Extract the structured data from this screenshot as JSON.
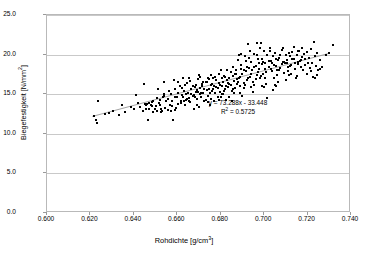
{
  "chart_data": {
    "type": "scatter",
    "title": "",
    "xlabel": "Rohdichte [g/cm³]",
    "ylabel": "Biegefestigkeit [N/mm²]",
    "xlabel_base": "Rohdichte [g/cm",
    "xlabel_sup": "3",
    "xlabel_tail": "]",
    "ylabel_base": "Biegefestigkeit [N/mm",
    "ylabel_sup": "2",
    "ylabel_tail": "]",
    "xlim": [
      0.6,
      0.74
    ],
    "ylim": [
      0.0,
      25.0
    ],
    "xticks": [
      0.6,
      0.62,
      0.64,
      0.66,
      0.68,
      0.7,
      0.72,
      0.74
    ],
    "yticks": [
      0.0,
      5.0,
      10.0,
      15.0,
      20.0,
      25.0
    ],
    "xtick_labels": [
      "0.600",
      "0.620",
      "0.640",
      "0.660",
      "0.680",
      "0.700",
      "0.720",
      "0.740"
    ],
    "ytick_labels": [
      "0.0",
      "5.0",
      "10.0",
      "15.0",
      "20.0",
      "25.0"
    ],
    "grid": "horizontal",
    "legend": "none",
    "marker_color": "#000000",
    "marker_shape": "square",
    "gridline_color": "#c9c9c9",
    "border_color": "#b9b9b9",
    "trendline": {
      "type": "linear",
      "slope": 73.288,
      "intercept": -33.448,
      "r_squared": 0.5725,
      "equation_label": "y = 73.288x - 33.448",
      "r2_label_base": "R",
      "r2_label_sup": "2",
      "r2_label_tail": " = 0.5725",
      "color": "#8c8c8c",
      "x_start": 0.621,
      "x_end": 0.731
    },
    "points": [
      [
        0.6215,
        12.2
      ],
      [
        0.6225,
        11.7
      ],
      [
        0.623,
        11.4
      ],
      [
        0.6235,
        14.1
      ],
      [
        0.6265,
        12.5
      ],
      [
        0.6285,
        12.6
      ],
      [
        0.6305,
        12.9
      ],
      [
        0.633,
        12.4
      ],
      [
        0.6345,
        13.6
      ],
      [
        0.636,
        12.8
      ],
      [
        0.6385,
        13.4
      ],
      [
        0.64,
        13.1
      ],
      [
        0.641,
        14.9
      ],
      [
        0.642,
        13.9
      ],
      [
        0.643,
        13.4
      ],
      [
        0.644,
        12.9
      ],
      [
        0.6445,
        16.3
      ],
      [
        0.645,
        13.8
      ],
      [
        0.6455,
        13.7
      ],
      [
        0.646,
        13.8
      ],
      [
        0.6465,
        11.7
      ],
      [
        0.647,
        13.2
      ],
      [
        0.648,
        13.6
      ],
      [
        0.6485,
        14.0
      ],
      [
        0.649,
        12.7
      ],
      [
        0.6495,
        13.1
      ],
      [
        0.65,
        13.5
      ],
      [
        0.6505,
        12.9
      ],
      [
        0.651,
        15.7
      ],
      [
        0.6515,
        13.9
      ],
      [
        0.652,
        14.3
      ],
      [
        0.6525,
        13.2
      ],
      [
        0.653,
        12.9
      ],
      [
        0.6535,
        14.6
      ],
      [
        0.654,
        16.5
      ],
      [
        0.6545,
        13.3
      ],
      [
        0.655,
        14.1
      ],
      [
        0.6555,
        14.4
      ],
      [
        0.656,
        15.4
      ],
      [
        0.6565,
        13.7
      ],
      [
        0.657,
        12.9
      ],
      [
        0.6575,
        14.2
      ],
      [
        0.658,
        11.8
      ],
      [
        0.6585,
        16.8
      ],
      [
        0.659,
        14.7
      ],
      [
        0.6595,
        13.3
      ],
      [
        0.66,
        14.6
      ],
      [
        0.6605,
        15.1
      ],
      [
        0.661,
        16.1
      ],
      [
        0.6615,
        14.2
      ],
      [
        0.662,
        14.9
      ],
      [
        0.6625,
        17.1
      ],
      [
        0.663,
        15.4
      ],
      [
        0.6635,
        13.6
      ],
      [
        0.664,
        14.3
      ],
      [
        0.6645,
        16.4
      ],
      [
        0.665,
        15.2
      ],
      [
        0.6655,
        14.1
      ],
      [
        0.666,
        16.7
      ],
      [
        0.6665,
        15.6
      ],
      [
        0.667,
        14.8
      ],
      [
        0.6675,
        13.2
      ],
      [
        0.668,
        15.9
      ],
      [
        0.6685,
        16.2
      ],
      [
        0.669,
        14.4
      ],
      [
        0.6695,
        15.3
      ],
      [
        0.67,
        17.4
      ],
      [
        0.6705,
        15.8
      ],
      [
        0.671,
        14.6
      ],
      [
        0.6715,
        16.0
      ],
      [
        0.672,
        15.1
      ],
      [
        0.6725,
        14.2
      ],
      [
        0.673,
        16.6
      ],
      [
        0.6735,
        15.5
      ],
      [
        0.674,
        14.8
      ],
      [
        0.6745,
        16.9
      ],
      [
        0.675,
        15.2
      ],
      [
        0.6755,
        14.4
      ],
      [
        0.676,
        16.3
      ],
      [
        0.6765,
        15.7
      ],
      [
        0.677,
        14.1
      ],
      [
        0.6775,
        17.2
      ],
      [
        0.678,
        15.9
      ],
      [
        0.6785,
        14.7
      ],
      [
        0.679,
        16.4
      ],
      [
        0.6795,
        15.3
      ],
      [
        0.68,
        18.1
      ],
      [
        0.6805,
        16.1
      ],
      [
        0.681,
        15.0
      ],
      [
        0.6815,
        17.3
      ],
      [
        0.682,
        15.6
      ],
      [
        0.6825,
        14.3
      ],
      [
        0.683,
        16.8
      ],
      [
        0.6835,
        15.9
      ],
      [
        0.684,
        17.0
      ],
      [
        0.6845,
        16.2
      ],
      [
        0.685,
        15.4
      ],
      [
        0.6855,
        18.4
      ],
      [
        0.686,
        16.7
      ],
      [
        0.6865,
        15.8
      ],
      [
        0.687,
        17.5
      ],
      [
        0.6875,
        16.3
      ],
      [
        0.688,
        19.3
      ],
      [
        0.6885,
        17.1
      ],
      [
        0.689,
        16.0
      ],
      [
        0.6895,
        18.2
      ],
      [
        0.69,
        17.6
      ],
      [
        0.6905,
        16.4
      ],
      [
        0.691,
        19.8
      ],
      [
        0.6915,
        17.9
      ],
      [
        0.692,
        16.8
      ],
      [
        0.6925,
        21.4
      ],
      [
        0.693,
        18.3
      ],
      [
        0.6935,
        17.2
      ],
      [
        0.694,
        19.1
      ],
      [
        0.6945,
        18.0
      ],
      [
        0.695,
        16.5
      ],
      [
        0.6955,
        20.1
      ],
      [
        0.696,
        18.6
      ],
      [
        0.6965,
        17.4
      ],
      [
        0.697,
        19.5
      ],
      [
        0.6975,
        18.2
      ],
      [
        0.698,
        17.0
      ],
      [
        0.6985,
        21.5
      ],
      [
        0.699,
        18.8
      ],
      [
        0.6995,
        17.6
      ],
      [
        0.7,
        20.4
      ],
      [
        0.7005,
        19.0
      ],
      [
        0.701,
        17.8
      ],
      [
        0.7015,
        14.5
      ],
      [
        0.702,
        18.4
      ],
      [
        0.7025,
        20.9
      ],
      [
        0.703,
        19.2
      ],
      [
        0.7035,
        17.9
      ],
      [
        0.704,
        15.5
      ],
      [
        0.7045,
        18.7
      ],
      [
        0.705,
        20.2
      ],
      [
        0.7055,
        19.4
      ],
      [
        0.706,
        18.1
      ],
      [
        0.7065,
        16.6
      ],
      [
        0.707,
        19.6
      ],
      [
        0.7075,
        18.3
      ],
      [
        0.708,
        20.6
      ],
      [
        0.7085,
        19.1
      ],
      [
        0.709,
        17.7
      ],
      [
        0.7095,
        18.9
      ],
      [
        0.71,
        20.0
      ],
      [
        0.7105,
        19.3
      ],
      [
        0.711,
        18.5
      ],
      [
        0.7115,
        17.4
      ],
      [
        0.712,
        19.8
      ],
      [
        0.7125,
        18.7
      ],
      [
        0.713,
        20.3
      ],
      [
        0.7135,
        19.5
      ],
      [
        0.714,
        18.2
      ],
      [
        0.7145,
        17.1
      ],
      [
        0.715,
        19.9
      ],
      [
        0.7155,
        18.8
      ],
      [
        0.716,
        20.5
      ],
      [
        0.7165,
        19.2
      ],
      [
        0.717,
        18.4
      ],
      [
        0.7175,
        19.7
      ],
      [
        0.718,
        18.0
      ],
      [
        0.7185,
        20.1
      ],
      [
        0.719,
        19.4
      ],
      [
        0.7195,
        17.6
      ],
      [
        0.72,
        18.9
      ],
      [
        0.7205,
        19.6
      ],
      [
        0.721,
        18.3
      ],
      [
        0.7215,
        20.7
      ],
      [
        0.722,
        19.0
      ],
      [
        0.7225,
        17.2
      ],
      [
        0.723,
        21.6
      ],
      [
        0.7235,
        19.8
      ],
      [
        0.724,
        18.6
      ],
      [
        0.7245,
        20.2
      ],
      [
        0.725,
        18.1
      ],
      [
        0.7255,
        19.3
      ],
      [
        0.7265,
        18.4
      ],
      [
        0.7285,
        20.0
      ],
      [
        0.73,
        20.2
      ],
      [
        0.7315,
        21.2
      ],
      [
        0.6505,
        14.5
      ],
      [
        0.6555,
        13.0
      ],
      [
        0.6605,
        13.8
      ],
      [
        0.6655,
        14.5
      ],
      [
        0.6705,
        15.0
      ],
      [
        0.6755,
        16.2
      ],
      [
        0.6805,
        17.0
      ],
      [
        0.6855,
        17.3
      ],
      [
        0.6905,
        18.0
      ],
      [
        0.6955,
        18.5
      ],
      [
        0.7005,
        18.2
      ],
      [
        0.7055,
        18.6
      ],
      [
        0.7105,
        19.0
      ],
      [
        0.7155,
        19.1
      ],
      [
        0.7205,
        19.6
      ],
      [
        0.647,
        13.9
      ],
      [
        0.652,
        13.6
      ],
      [
        0.657,
        15.0
      ],
      [
        0.662,
        15.8
      ],
      [
        0.667,
        16.1
      ],
      [
        0.672,
        16.5
      ],
      [
        0.677,
        16.0
      ],
      [
        0.682,
        17.2
      ],
      [
        0.687,
        18.1
      ],
      [
        0.692,
        18.4
      ],
      [
        0.697,
        17.8
      ],
      [
        0.702,
        19.2
      ],
      [
        0.707,
        18.0
      ],
      [
        0.712,
        18.6
      ],
      [
        0.717,
        19.3
      ],
      [
        0.649,
        14.2
      ],
      [
        0.654,
        14.8
      ],
      [
        0.659,
        15.6
      ],
      [
        0.664,
        15.0
      ],
      [
        0.669,
        15.5
      ],
      [
        0.674,
        17.1
      ],
      [
        0.679,
        17.5
      ],
      [
        0.684,
        16.3
      ],
      [
        0.689,
        17.2
      ],
      [
        0.694,
        17.5
      ],
      [
        0.699,
        19.4
      ],
      [
        0.704,
        19.8
      ],
      [
        0.709,
        19.1
      ],
      [
        0.714,
        18.9
      ],
      [
        0.719,
        18.7
      ],
      [
        0.666,
        14.0
      ],
      [
        0.671,
        15.2
      ],
      [
        0.676,
        15.4
      ],
      [
        0.681,
        16.6
      ],
      [
        0.686,
        15.2
      ],
      [
        0.691,
        16.2
      ],
      [
        0.696,
        16.9
      ],
      [
        0.701,
        16.3
      ],
      [
        0.706,
        17.4
      ],
      [
        0.711,
        17.9
      ],
      [
        0.668,
        14.6
      ],
      [
        0.673,
        14.3
      ],
      [
        0.678,
        16.8
      ],
      [
        0.683,
        18.0
      ],
      [
        0.688,
        16.6
      ],
      [
        0.693,
        19.6
      ],
      [
        0.698,
        20.8
      ],
      [
        0.703,
        18.2
      ],
      [
        0.708,
        18.8
      ],
      [
        0.713,
        19.5
      ],
      [
        0.6615,
        13.9
      ],
      [
        0.6645,
        14.4
      ],
      [
        0.6695,
        16.9
      ],
      [
        0.6745,
        15.6
      ],
      [
        0.6795,
        16.2
      ],
      [
        0.6845,
        17.8
      ],
      [
        0.6895,
        18.7
      ],
      [
        0.6945,
        18.1
      ],
      [
        0.6995,
        19.1
      ],
      [
        0.7045,
        17.0
      ],
      [
        0.6455,
        13.2
      ],
      [
        0.6485,
        13.5
      ],
      [
        0.6525,
        12.7
      ],
      [
        0.6575,
        13.5
      ],
      [
        0.6625,
        14.7
      ],
      [
        0.6675,
        14.9
      ],
      [
        0.6725,
        15.7
      ],
      [
        0.6775,
        15.1
      ],
      [
        0.6825,
        16.0
      ],
      [
        0.6875,
        16.9
      ],
      [
        0.6925,
        17.0
      ],
      [
        0.6975,
        18.9
      ],
      [
        0.7025,
        20.4
      ],
      [
        0.7075,
        19.9
      ],
      [
        0.7125,
        17.5
      ],
      [
        0.6665,
        15.0
      ],
      [
        0.6715,
        16.3
      ],
      [
        0.6765,
        17.0
      ],
      [
        0.6815,
        15.4
      ],
      [
        0.6865,
        17.6
      ],
      [
        0.6915,
        19.2
      ],
      [
        0.6965,
        19.9
      ],
      [
        0.7015,
        20.0
      ],
      [
        0.7065,
        19.3
      ],
      [
        0.7115,
        20.2
      ],
      [
        0.67,
        13.4
      ],
      [
        0.675,
        13.6
      ],
      [
        0.68,
        14.6
      ],
      [
        0.685,
        14.2
      ],
      [
        0.69,
        14.8
      ],
      [
        0.695,
        15.3
      ],
      [
        0.7,
        15.9
      ],
      [
        0.705,
        16.2
      ],
      [
        0.71,
        16.8
      ],
      [
        0.715,
        17.3
      ],
      [
        0.6635,
        16.2
      ],
      [
        0.6685,
        15.3
      ],
      [
        0.6735,
        16.5
      ],
      [
        0.6785,
        15.8
      ],
      [
        0.6835,
        16.4
      ],
      [
        0.6885,
        19.9
      ],
      [
        0.6935,
        20.5
      ],
      [
        0.6985,
        17.3
      ],
      [
        0.7035,
        18.9
      ],
      [
        0.7085,
        20.9
      ],
      [
        0.6605,
        16.5
      ],
      [
        0.6655,
        17.0
      ],
      [
        0.6705,
        17.2
      ],
      [
        0.6755,
        17.4
      ],
      [
        0.6805,
        15.0
      ],
      [
        0.6855,
        15.6
      ],
      [
        0.6905,
        15.8
      ],
      [
        0.6955,
        16.2
      ],
      [
        0.7005,
        17.1
      ],
      [
        0.7055,
        16.0
      ],
      [
        0.654,
        15.0
      ],
      [
        0.659,
        13.0
      ],
      [
        0.663,
        14.1
      ],
      [
        0.669,
        13.6
      ],
      [
        0.674,
        14.0
      ],
      [
        0.679,
        14.3
      ],
      [
        0.684,
        14.6
      ],
      [
        0.689,
        15.1
      ],
      [
        0.694,
        15.9
      ],
      [
        0.699,
        16.1
      ],
      [
        0.7245,
        17.4
      ],
      [
        0.7255,
        18.2
      ],
      [
        0.7235,
        17.0
      ],
      [
        0.7215,
        17.9
      ],
      [
        0.7195,
        20.3
      ],
      [
        0.7175,
        20.8
      ],
      [
        0.7155,
        20.5
      ],
      [
        0.7135,
        21.0
      ],
      [
        0.6965,
        21.5
      ],
      [
        0.6895,
        20.1
      ]
    ]
  }
}
